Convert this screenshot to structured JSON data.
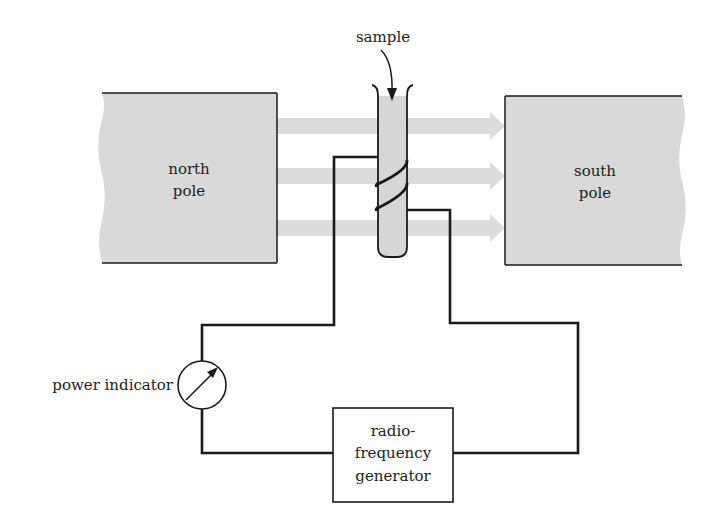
{
  "diagram": {
    "labels": {
      "north_pole_line1": "north",
      "north_pole_line2": "pole",
      "south_pole_line1": "south",
      "south_pole_line2": "pole",
      "sample": "sample",
      "power_indicator": "power indicator",
      "generator_line1": "radio-",
      "generator_line2": "frequency",
      "generator_line3": "generator"
    },
    "colors": {
      "magnet_fill": "#d9d9d9",
      "field_arrow": "#dcdcdc",
      "sample_fill": "#d6d6d6",
      "wire": "#1a1a1a",
      "text": "#222222"
    },
    "field_arrows": 3
  }
}
